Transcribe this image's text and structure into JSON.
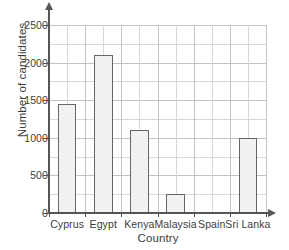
{
  "chart_data": {
    "type": "bar",
    "title": "",
    "xlabel": "Country",
    "ylabel": "Number of candidates",
    "categories": [
      "Cyprus",
      "Egypt",
      "Kenya",
      "Malaysia",
      "Spain",
      "Sri Lanka"
    ],
    "values": [
      1450,
      2100,
      1100,
      250,
      0,
      1000
    ],
    "ylim": [
      0,
      2500
    ],
    "y_ticks": [
      0,
      500,
      1000,
      1500,
      2000,
      2500
    ],
    "y_tick_labels": [
      "0",
      "500",
      "1000",
      "1500",
      "2000",
      "2500"
    ],
    "y_minor_step": 250,
    "grid": true,
    "legend": null,
    "bar_fill_color": "#f1f1f1",
    "bar_border_color": "#666666",
    "gridline_color": "#d8d8d8",
    "axis_color": "#555555",
    "text_color": "#3d3d3d"
  }
}
